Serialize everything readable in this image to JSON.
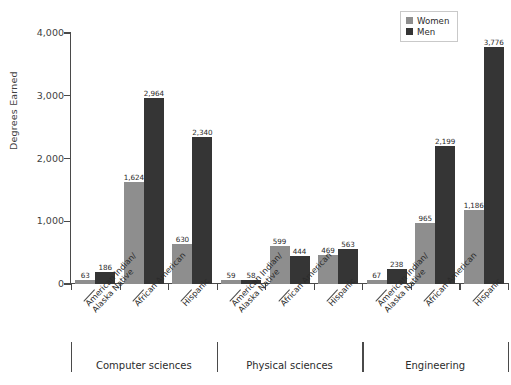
{
  "chart_data": {
    "type": "bar",
    "title": "",
    "xlabel": "",
    "ylabel": "Degrees Earned",
    "ylim": [
      0,
      4000
    ],
    "yticks": [
      0,
      1000,
      2000,
      3000,
      4000
    ],
    "ytick_labels": [
      "0",
      "1,000",
      "2,000",
      "3,000",
      "4,000"
    ],
    "grid": false,
    "legend_position": "top-right",
    "series": [
      {
        "name": "Women",
        "color": "#8e8e8e",
        "values": [
          63,
          1624,
          630,
          59,
          599,
          469,
          67,
          965,
          1186
        ]
      },
      {
        "name": "Men",
        "color": "#353535",
        "values": [
          186,
          2964,
          2340,
          58,
          444,
          563,
          238,
          2199,
          3776
        ]
      }
    ],
    "categories": [
      "American Indian/\nAlaska Native",
      "African American",
      "Hispanic",
      "American Indian/\nAlaska Native",
      "African American",
      "Hispanic",
      "American Indian/\nAlaska Native",
      "African American",
      "Hispanic"
    ],
    "groups": [
      {
        "label": "Computer sciences",
        "start": 0,
        "end": 2
      },
      {
        "label": "Physical sciences",
        "start": 3,
        "end": 5
      },
      {
        "label": "Engineering",
        "start": 6,
        "end": 8
      }
    ]
  },
  "legend": {
    "items": [
      {
        "label": "Women",
        "color": "#8e8e8e"
      },
      {
        "label": "Men",
        "color": "#353535"
      }
    ]
  },
  "axis": {
    "y_title": "Degrees Earned"
  }
}
